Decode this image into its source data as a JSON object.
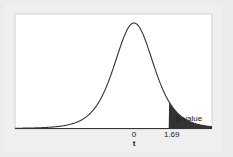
{
  "chart_data": {
    "type": "area",
    "title": "",
    "xlabel": "t",
    "ylabel": "",
    "x_ticks": [
      "0",
      "1.69"
    ],
    "critical_value": 1.69,
    "shaded_region": "t > 1.69",
    "annotations": [
      "p-value"
    ],
    "xlim": [
      -4,
      4
    ],
    "grid": false,
    "legend": "none",
    "colors": {
      "curve": "#333333",
      "shade": "#333333",
      "background": "#ffffff"
    }
  },
  "labels": {
    "tick_zero": "0",
    "tick_cut": "1.69",
    "x_axis": "t",
    "pvalue": "p-value"
  }
}
